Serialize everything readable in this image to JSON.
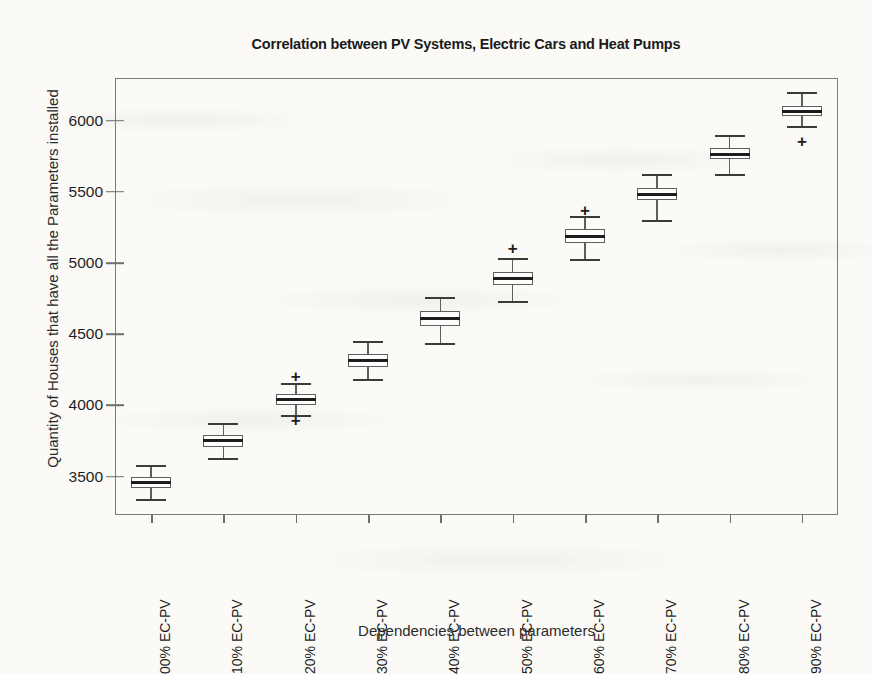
{
  "chart_data": {
    "type": "box",
    "title": "Correlation between PV Systems, Electric Cars and Heat Pumps",
    "xlabel": "Dependencies between parameters",
    "ylabel": "Quantity of Houses that have all the Parameters installed",
    "categories": [
      "00% EC-PV",
      "10% EC-PV",
      "20% EC-PV",
      "30% EC-PV",
      "40% EC-PV",
      "50% EC-PV",
      "60% EC-PV",
      "70% EC-PV",
      "80% EC-PV",
      "90% EC-PV"
    ],
    "ytick_labels": [
      "3500",
      "4000",
      "4500",
      "5000",
      "5500",
      "6000"
    ],
    "yticks": [
      3500,
      4000,
      4500,
      5000,
      5500,
      6000
    ],
    "ylim": [
      3230,
      6300
    ],
    "grid": false,
    "legend": null,
    "boxes": [
      {
        "category": "00% EC-PV",
        "whisker_low": 3340,
        "q1": 3420,
        "median": 3460,
        "q3": 3500,
        "whisker_high": 3580,
        "outliers": []
      },
      {
        "category": "10% EC-PV",
        "whisker_low": 3630,
        "q1": 3710,
        "median": 3750,
        "q3": 3790,
        "whisker_high": 3875,
        "outliers": []
      },
      {
        "category": "20% EC-PV",
        "whisker_low": 3930,
        "q1": 4000,
        "median": 4040,
        "q3": 4080,
        "whisker_high": 4155,
        "outliers": [
          4205,
          3895
        ]
      },
      {
        "category": "30% EC-PV",
        "whisker_low": 4185,
        "q1": 4270,
        "median": 4315,
        "q3": 4360,
        "whisker_high": 4450,
        "outliers": []
      },
      {
        "category": "40% EC-PV",
        "whisker_low": 4440,
        "q1": 4560,
        "median": 4610,
        "q3": 4660,
        "whisker_high": 4760,
        "outliers": []
      },
      {
        "category": "50% EC-PV",
        "whisker_low": 4735,
        "q1": 4845,
        "median": 4890,
        "q3": 4940,
        "whisker_high": 5035,
        "outliers": [
          5105
        ]
      },
      {
        "category": "60% EC-PV",
        "whisker_low": 5025,
        "q1": 5140,
        "median": 5190,
        "q3": 5240,
        "whisker_high": 5330,
        "outliers": [
          5375
        ]
      },
      {
        "category": "70% EC-PV",
        "whisker_low": 5300,
        "q1": 5440,
        "median": 5485,
        "q3": 5530,
        "whisker_high": 5625,
        "outliers": []
      },
      {
        "category": "80% EC-PV",
        "whisker_low": 5625,
        "q1": 5730,
        "median": 5765,
        "q3": 5805,
        "whisker_high": 5900,
        "outliers": []
      },
      {
        "category": "90% EC-PV",
        "whisker_low": 5965,
        "q1": 6030,
        "median": 6065,
        "q3": 6100,
        "whisker_high": 6200,
        "outliers": [
          5855
        ]
      }
    ],
    "colors": {
      "box_edge": "#5f5f5f",
      "box_fill": "#fdfdfb",
      "median": "#1d1d1d",
      "whisker": "#5f5f5f",
      "outlier": "#1d1d1d",
      "axis": "#7b7b7b",
      "text": "#1a1a1a",
      "background": "#fbfaf7"
    }
  }
}
